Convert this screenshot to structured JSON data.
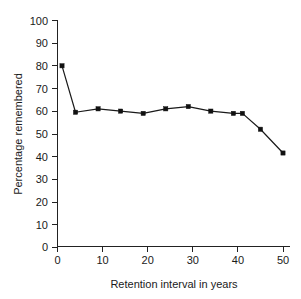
{
  "chart_data": {
    "type": "line",
    "title": "",
    "xlabel": "Retention interval in years",
    "ylabel": "Percentage remembered",
    "xlim": [
      0,
      52
    ],
    "ylim": [
      0,
      100
    ],
    "xticks": [
      0,
      10,
      20,
      30,
      40,
      50
    ],
    "yticks": [
      0,
      10,
      20,
      30,
      40,
      50,
      60,
      70,
      80,
      90,
      100
    ],
    "grid": false,
    "legend": null,
    "series": [
      {
        "name": "Percentage remembered",
        "marker": "filled-square",
        "color": "#111111",
        "x": [
          1,
          4,
          9,
          14,
          19,
          24,
          29,
          34,
          39,
          41,
          45,
          50
        ],
        "y": [
          80,
          59.5,
          61,
          60,
          59,
          61,
          62,
          60,
          59,
          59,
          52,
          41.5
        ]
      }
    ]
  },
  "axes": {
    "x_tick_labels": [
      "0",
      "10",
      "20",
      "30",
      "40",
      "50"
    ],
    "y_tick_labels": [
      "0",
      "10",
      "20",
      "30",
      "40",
      "50",
      "60",
      "70",
      "80",
      "90",
      "100"
    ],
    "x_axis_title": "Retention interval in years",
    "y_axis_title": "Percentage remembered"
  },
  "colors": {
    "line": "#1a1a1a",
    "marker": "#111111",
    "axis": "#222222",
    "text": "#1a1a1a",
    "background": "#ffffff"
  }
}
